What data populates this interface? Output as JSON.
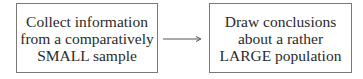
{
  "diagram": {
    "type": "flow",
    "colors": {
      "border": "#7a7a7a",
      "text": "#2a2a2a",
      "arrow": "#555555",
      "background": "#ffffff"
    },
    "nodes": [
      {
        "id": "collect",
        "lines": [
          "Collect information",
          "from a comparatively",
          "SMALL sample"
        ]
      },
      {
        "id": "conclude",
        "lines": [
          "Draw conclusions",
          "about a rather",
          "LARGE population"
        ]
      }
    ],
    "edges": [
      {
        "from": "collect",
        "to": "conclude",
        "icon": "arrow-right-icon"
      }
    ]
  }
}
